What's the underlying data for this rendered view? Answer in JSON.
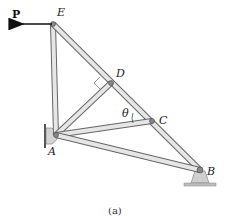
{
  "figure": {
    "caption": "(a)",
    "force_label": "P",
    "angle_label": "θ",
    "joints": {
      "A": {
        "label": "A"
      },
      "B": {
        "label": "B"
      },
      "C": {
        "label": "C"
      },
      "D": {
        "label": "D"
      },
      "E": {
        "label": "E"
      }
    },
    "colors": {
      "member_fill": "#e6e6e6",
      "member_stroke": "#666666",
      "arrow": "#111111",
      "support": "#cfcfcf"
    }
  }
}
